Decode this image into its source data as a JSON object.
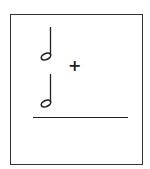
{
  "problem": {
    "operand_1": "half-note",
    "operator": "+",
    "operand_2": "half-note",
    "answer": ""
  }
}
